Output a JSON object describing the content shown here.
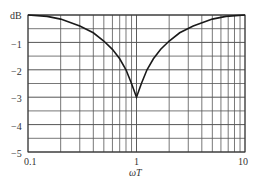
{
  "chart_data": {
    "type": "line",
    "title": "",
    "xlabel": "ωT",
    "ylabel": "dB",
    "xscale": "log",
    "xlim": [
      0.1,
      10
    ],
    "ylim": [
      -5,
      0
    ],
    "grid": true,
    "x_tick_labels": [
      "0.1",
      "1",
      "10"
    ],
    "y_tick_labels": [
      "dB",
      "−1",
      "−2",
      "−3",
      "−4",
      "−5"
    ],
    "series": [
      {
        "name": "magnitude",
        "x": [
          0.1,
          0.15,
          0.2,
          0.3,
          0.4,
          0.5,
          0.6,
          0.7,
          0.8,
          0.9,
          1.0,
          1.11,
          1.25,
          1.43,
          1.67,
          2.0,
          2.5,
          3.33,
          5.0,
          6.67,
          10
        ],
        "y": [
          0.0,
          -0.05,
          -0.15,
          -0.4,
          -0.65,
          -0.95,
          -1.25,
          -1.6,
          -2.0,
          -2.5,
          -3.0,
          -2.5,
          -2.0,
          -1.6,
          -1.25,
          -0.95,
          -0.65,
          -0.4,
          -0.15,
          -0.05,
          0.0
        ]
      }
    ]
  },
  "labels": {
    "ylabel": "dB",
    "xlabel": "ωT",
    "y1": "−1",
    "y2": "−2",
    "y3": "−3",
    "y4": "−4",
    "y5": "−5",
    "x0": "0.1",
    "x1": "1",
    "x2": "10"
  },
  "colors": {
    "grid": "#555555",
    "curve": "#1a1a1a"
  }
}
